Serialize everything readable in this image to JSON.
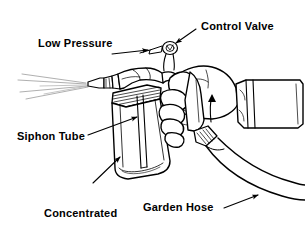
{
  "figure": {
    "kind": "line-art-diagram",
    "background_color": "#ffffff",
    "ink_color": "#000000",
    "width": 305,
    "height": 225
  },
  "labels": {
    "control_valve": "Control Valve",
    "low_pressure": "Low Pressure",
    "siphon_tube": "Siphon Tube",
    "concentrated": "Concentrated",
    "pesticide": "Pesticide",
    "garden_hose": "Garden Hose"
  },
  "callouts": [
    {
      "name": "control-valve",
      "text": "Control Valve",
      "leader_from": [
        196,
        29
      ],
      "leader_to": [
        172,
        45
      ]
    },
    {
      "name": "low-pressure",
      "text": "Low Pressure",
      "leader_from": [
        112,
        54
      ],
      "leader_to": [
        152,
        50
      ]
    },
    {
      "name": "siphon-tube",
      "text": "Siphon Tube",
      "leader_from": [
        88,
        135
      ],
      "leader_to": [
        141,
        116
      ]
    },
    {
      "name": "concentrated-pesticide",
      "text": "Concentrated Pesticide",
      "leader_from": [
        93,
        183
      ],
      "leader_to": [
        122,
        154
      ]
    },
    {
      "name": "garden-hose",
      "text": "Garden Hose",
      "leader_from": [
        224,
        208
      ],
      "leader_to": [
        262,
        193
      ]
    }
  ],
  "parts": [
    {
      "name": "spray-fan",
      "description": "Fine spray fanning out to the left of the nozzle"
    },
    {
      "name": "nozzle",
      "description": "Tapered spray nozzle at the front of the sprayer head"
    },
    {
      "name": "sprayer-head",
      "description": "Body of the sprayer that screws onto the jar"
    },
    {
      "name": "control-valve-knob",
      "description": "Small round thumb valve on top of the sprayer head"
    },
    {
      "name": "jar",
      "description": "Glass jar holding the concentrate, with threaded neck"
    },
    {
      "name": "siphon-tube",
      "description": "Vertical tube running from the jar bottom into the sprayer head"
    },
    {
      "name": "hand",
      "description": "Hand gripping the sprayer handle"
    },
    {
      "name": "shirt-cuff",
      "description": "Shirt cuff at the wrist on the right edge"
    },
    {
      "name": "garden-hose",
      "description": "Garden hose attached at the rear, curving to the lower right"
    },
    {
      "name": "hose-coupling",
      "description": "Ribbed threaded coupling joining hose to sprayer"
    }
  ]
}
